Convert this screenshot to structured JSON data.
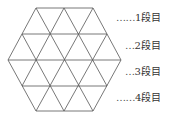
{
  "diagram": {
    "shape": "regular hexagon subdivided into 24 equilateral triangles",
    "stroke_color": "#555555",
    "rows": [
      {
        "dots": "……",
        "label": "1段目"
      },
      {
        "dots": "…",
        "label": "2段目"
      },
      {
        "dots": "…",
        "label": "3段目"
      },
      {
        "dots": "……",
        "label": "4段目"
      }
    ]
  }
}
